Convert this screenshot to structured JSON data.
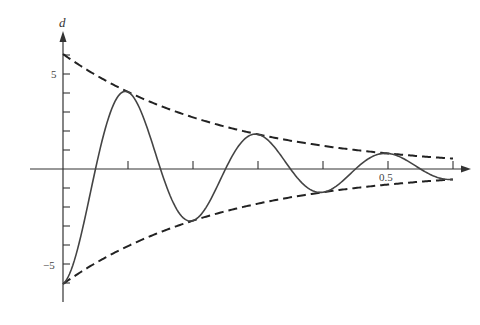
{
  "chart_data": {
    "type": "line",
    "title": "",
    "xlabel": "",
    "ylabel": "d",
    "xlim": [
      0,
      0.6
    ],
    "ylim": [
      -6.05,
      6.05
    ],
    "x_ticks": [
      0,
      0.1,
      0.2,
      0.3,
      0.4,
      0.5,
      0.6
    ],
    "x_tick_labels": [
      {
        "value": 0.5,
        "label": "0.5"
      }
    ],
    "y_ticks": [
      -6,
      -5,
      -4,
      -3,
      -2,
      -1,
      1,
      2,
      3,
      4,
      5,
      6
    ],
    "y_tick_labels": [
      {
        "value": 5,
        "label": "5"
      },
      {
        "value": -5,
        "label": "−5"
      }
    ],
    "grid": false,
    "legend": null,
    "model": {
      "form": "d = -A e^(-k t) cos(2π t / T)",
      "A": 6.05,
      "k": 4.0,
      "T": 0.2
    },
    "series": [
      {
        "name": "damped-oscillation",
        "style": "solid",
        "x": [
          0,
          0.05,
          0.1,
          0.15,
          0.2,
          0.25,
          0.3,
          0.35,
          0.4,
          0.45,
          0.5,
          0.55,
          0.6
        ],
        "values": [
          -6.05,
          0,
          4.06,
          0,
          -2.72,
          0,
          1.82,
          0,
          -1.22,
          0,
          0.82,
          0,
          -0.55
        ]
      },
      {
        "name": "upper-envelope",
        "style": "dashed",
        "x": [
          0,
          0.1,
          0.2,
          0.3,
          0.4,
          0.5,
          0.6
        ],
        "values": [
          6.05,
          4.06,
          2.72,
          1.82,
          1.22,
          0.82,
          0.55
        ]
      },
      {
        "name": "lower-envelope",
        "style": "dashed",
        "x": [
          0,
          0.1,
          0.2,
          0.3,
          0.4,
          0.5,
          0.6
        ],
        "values": [
          -6.05,
          -4.06,
          -2.72,
          -1.82,
          -1.22,
          -0.82,
          -0.55
        ]
      }
    ]
  },
  "labels": {
    "y_axis": "d",
    "y_pos": "5",
    "y_neg": "−5",
    "x_half": "0.5"
  }
}
